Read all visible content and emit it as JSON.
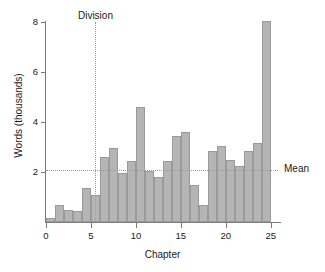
{
  "chart_data": {
    "type": "bar",
    "title": "",
    "xlabel": "Chapter",
    "ylabel": "Words (thousands)",
    "xlim": [
      0,
      25.8
    ],
    "ylim": [
      0,
      8
    ],
    "grid": false,
    "legend": "none",
    "categories": [
      1,
      2,
      3,
      4,
      5,
      6,
      7,
      8,
      9,
      10,
      11,
      12,
      13,
      14,
      15,
      16,
      17,
      18,
      19,
      20,
      21,
      22,
      23,
      24,
      25
    ],
    "values": [
      0.15,
      0.7,
      0.5,
      0.45,
      1.35,
      1.1,
      2.6,
      2.95,
      1.95,
      2.45,
      4.6,
      2.05,
      1.8,
      2.45,
      3.45,
      3.6,
      1.5,
      0.7,
      2.85,
      3.05,
      2.5,
      2.25,
      2.85,
      3.15,
      8.05
    ],
    "series": [
      {
        "name": "Words per chapter",
        "values": [
          0.15,
          0.7,
          0.5,
          0.45,
          1.35,
          1.1,
          2.6,
          2.95,
          1.95,
          2.45,
          4.6,
          2.05,
          1.8,
          2.45,
          3.45,
          3.6,
          1.5,
          0.7,
          2.85,
          3.05,
          2.5,
          2.25,
          2.85,
          3.15,
          8.05
        ]
      }
    ],
    "x_ticks": [
      0,
      5,
      10,
      15,
      20,
      25
    ],
    "x_tick_labels": [
      "0",
      "5",
      "10",
      "15",
      "20",
      "25"
    ],
    "y_ticks": [
      2,
      4,
      6,
      8
    ],
    "y_tick_labels": [
      "2",
      "4",
      "6",
      "8"
    ],
    "annotations": [
      {
        "name": "mean",
        "label": "Mean",
        "type": "hline",
        "value": 2.1
      },
      {
        "name": "division",
        "label": "Division",
        "type": "vline",
        "value": 5.5
      }
    ],
    "colors": {
      "bar_fill": "#b5b5b5",
      "bar_stroke": "#9a9a9a",
      "axis": "#7a7a7a",
      "reference_line": "#9a9a9a",
      "text": "#1a1a1a",
      "background": "#ffffff"
    }
  }
}
